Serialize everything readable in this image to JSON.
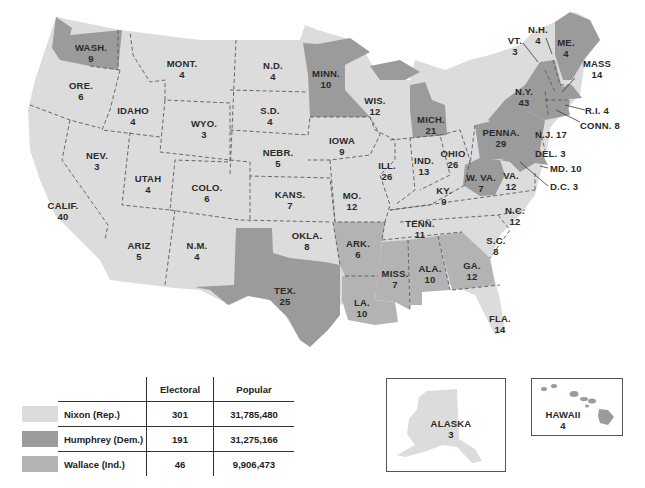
{
  "colors": {
    "nixon": "#dcdcdc",
    "humphrey": "#9b9b9b",
    "wallace": "#b3b3b3",
    "background": "#ffffff"
  },
  "states": {
    "wash": {
      "abbr": "WASH.",
      "ev": "9",
      "winner": "humphrey"
    },
    "ore": {
      "abbr": "ORE.",
      "ev": "6",
      "winner": "nixon"
    },
    "calif": {
      "abbr": "CALIF.",
      "ev": "40",
      "winner": "nixon"
    },
    "idaho": {
      "abbr": "IDAHO",
      "ev": "4",
      "winner": "nixon"
    },
    "nev": {
      "abbr": "NEV.",
      "ev": "3",
      "winner": "nixon"
    },
    "mont": {
      "abbr": "MONT.",
      "ev": "4",
      "winner": "nixon"
    },
    "wyo": {
      "abbr": "WYO.",
      "ev": "3",
      "winner": "nixon"
    },
    "utah": {
      "abbr": "UTAH",
      "ev": "4",
      "winner": "nixon"
    },
    "ariz": {
      "abbr": "ARIZ",
      "ev": "5",
      "winner": "nixon"
    },
    "colo": {
      "abbr": "COLO.",
      "ev": "6",
      "winner": "nixon"
    },
    "nm": {
      "abbr": "N.M.",
      "ev": "4",
      "winner": "nixon"
    },
    "nd": {
      "abbr": "N.D.",
      "ev": "4",
      "winner": "nixon"
    },
    "sd": {
      "abbr": "S.D.",
      "ev": "4",
      "winner": "nixon"
    },
    "nebr": {
      "abbr": "NEBR.",
      "ev": "5",
      "winner": "nixon"
    },
    "kans": {
      "abbr": "KANS.",
      "ev": "7",
      "winner": "nixon"
    },
    "okla": {
      "abbr": "OKLA.",
      "ev": "8",
      "winner": "nixon"
    },
    "tex": {
      "abbr": "TEX.",
      "ev": "25",
      "winner": "humphrey"
    },
    "minn": {
      "abbr": "MINN.",
      "ev": "10",
      "winner": "humphrey"
    },
    "iowa": {
      "abbr": "IOWA",
      "ev": "9",
      "winner": "nixon"
    },
    "mo": {
      "abbr": "MO.",
      "ev": "12",
      "winner": "nixon"
    },
    "ark": {
      "abbr": "ARK.",
      "ev": "6",
      "winner": "wallace"
    },
    "la": {
      "abbr": "LA.",
      "ev": "10",
      "winner": "wallace"
    },
    "wis": {
      "abbr": "WIS.",
      "ev": "12",
      "winner": "nixon"
    },
    "ill": {
      "abbr": "ILL.",
      "ev": "26",
      "winner": "nixon"
    },
    "mich": {
      "abbr": "MICH.",
      "ev": "21",
      "winner": "humphrey"
    },
    "ind": {
      "abbr": "IND.",
      "ev": "13",
      "winner": "nixon"
    },
    "ohio": {
      "abbr": "OHIO",
      "ev": "26",
      "winner": "nixon"
    },
    "ky": {
      "abbr": "KY.",
      "ev": "9",
      "winner": "nixon"
    },
    "tenn": {
      "abbr": "TENN.",
      "ev": "11",
      "winner": "nixon"
    },
    "miss": {
      "abbr": "MISS.",
      "ev": "7",
      "winner": "wallace"
    },
    "ala": {
      "abbr": "ALA.",
      "ev": "10",
      "winner": "wallace"
    },
    "ga": {
      "abbr": "GA.",
      "ev": "12",
      "winner": "wallace"
    },
    "fla": {
      "abbr": "FLA.",
      "ev": "14",
      "winner": "nixon"
    },
    "sc": {
      "abbr": "S.C.",
      "ev": "8",
      "winner": "nixon"
    },
    "nc": {
      "abbr": "N.C.",
      "ev": "12",
      "winner": "nixon"
    },
    "va": {
      "abbr": "VA.",
      "ev": "12",
      "winner": "nixon"
    },
    "wva": {
      "abbr": "W. VA.",
      "ev": "7",
      "winner": "humphrey"
    },
    "penna": {
      "abbr": "PENNA.",
      "ev": "29",
      "winner": "humphrey"
    },
    "ny": {
      "abbr": "N.Y.",
      "ev": "43",
      "winner": "humphrey"
    },
    "vt": {
      "abbr": "VT.",
      "ev": "3",
      "winner": "nixon"
    },
    "nh": {
      "abbr": "N.H.",
      "ev": "4",
      "winner": "nixon"
    },
    "me": {
      "abbr": "ME.",
      "ev": "4",
      "winner": "humphrey"
    },
    "mass": {
      "abbr": "MASS",
      "ev": "14",
      "winner": "humphrey"
    },
    "ri": {
      "label": "R.I. 4",
      "winner": "humphrey"
    },
    "conn": {
      "label": "CONN. 8",
      "winner": "humphrey"
    },
    "nj": {
      "label": "N.J. 17",
      "winner": "nixon"
    },
    "del": {
      "label": "DEL. 3",
      "winner": "nixon"
    },
    "md": {
      "label": "MD. 10",
      "winner": "humphrey"
    },
    "dc": {
      "label": "D.C. 3",
      "winner": "humphrey"
    },
    "alaska": {
      "abbr": "ALASKA",
      "ev": "3",
      "winner": "nixon"
    },
    "hawaii": {
      "abbr": "HAWAII",
      "ev": "4",
      "winner": "humphrey"
    }
  },
  "legend": {
    "headers": {
      "electoral": "Electoral",
      "popular": "Popular"
    },
    "rows": [
      {
        "candidate": "Nixon (Rep.)",
        "electoral": "301",
        "popular": "31,785,480",
        "color_key": "nixon"
      },
      {
        "candidate": "Humphrey (Dem.)",
        "electoral": "191",
        "popular": "31,275,166",
        "color_key": "humphrey"
      },
      {
        "candidate": "Wallace (Ind.)",
        "electoral": "46",
        "popular": "9,906,473",
        "color_key": "wallace"
      }
    ]
  }
}
